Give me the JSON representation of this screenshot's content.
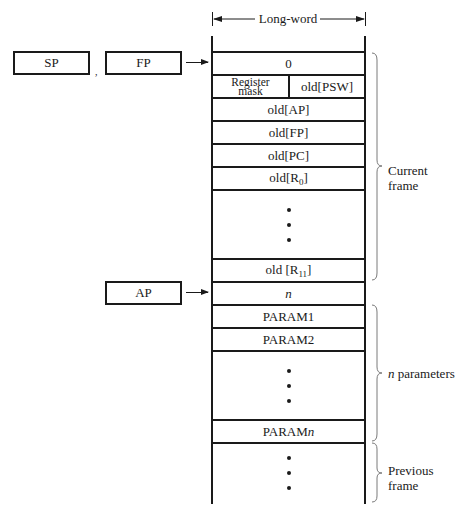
{
  "header": {
    "width_label": "Long-word"
  },
  "registers": {
    "sp": "SP",
    "fp": "FP",
    "ap": "AP",
    "separator": ","
  },
  "stack": {
    "rows": [
      {
        "id": "zero",
        "label": "0"
      },
      {
        "id": "register-mask",
        "label_line1": "Register",
        "label_line2": "mask"
      },
      {
        "id": "old-psw",
        "label": "old[PSW]"
      },
      {
        "id": "old-ap",
        "label": "old[AP]"
      },
      {
        "id": "old-fp",
        "label": "old[FP]"
      },
      {
        "id": "old-pc",
        "label": "old[PC]"
      },
      {
        "id": "old-r0",
        "label_prefix": "old[R",
        "label_sub": "0",
        "label_suffix": "]"
      },
      {
        "id": "dots-registers",
        "label": "..."
      },
      {
        "id": "old-r11",
        "label_prefix": "old [R",
        "label_sub": "11",
        "label_suffix": "]"
      },
      {
        "id": "n",
        "label": "n"
      },
      {
        "id": "param1",
        "label": "PARAM1"
      },
      {
        "id": "param2",
        "label": "PARAM2"
      },
      {
        "id": "dots-params",
        "label": "..."
      },
      {
        "id": "paramn",
        "label_prefix": "PARAM",
        "label_italic": "n"
      },
      {
        "id": "dots-previous",
        "label": "..."
      }
    ]
  },
  "brackets": {
    "current_frame": {
      "line1": "Current",
      "line2": "frame"
    },
    "n_parameters": {
      "italic": "n",
      "text": " parameters"
    },
    "previous_frame": {
      "line1": "Previous",
      "line2": "frame"
    }
  },
  "colors": {
    "ink": "#1a1a1a",
    "bracket": "#7a7a7a",
    "background": "#ffffff"
  }
}
